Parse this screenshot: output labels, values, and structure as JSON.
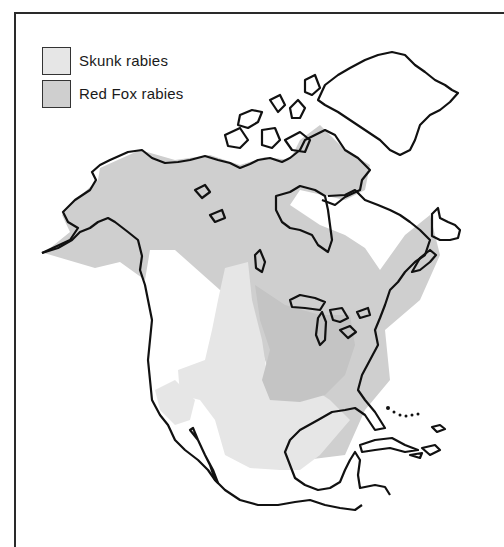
{
  "map": {
    "title": "",
    "region": "North America",
    "legend": [
      {
        "label": "Skunk rabies",
        "color": "#e6e6e6"
      },
      {
        "label": "Red Fox rabies",
        "color": "#cfcfcf"
      }
    ],
    "colors": {
      "background": "#ffffff",
      "outline": "#111111",
      "skunk": "#e6e6e6",
      "red_fox": "#cfcfcf",
      "overlap": "#c2c2c2"
    }
  }
}
